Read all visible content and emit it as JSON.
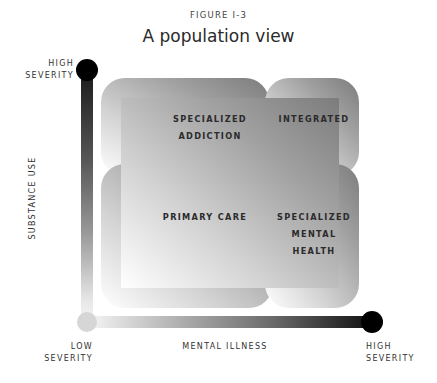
{
  "figure": {
    "label": "FIGURE I-3",
    "title": "A population view"
  },
  "axes": {
    "y": {
      "name": "SUBSTANCE USE",
      "high_label_line1": "HIGH",
      "high_label_line2": "SEVERITY"
    },
    "x": {
      "name": "MENTAL ILLNESS",
      "low_label_line1": "LOW",
      "low_label_line2": "SEVERITY",
      "high_label_line1": "HIGH",
      "high_label_line2": "SEVERITY"
    }
  },
  "regions": {
    "top_left": {
      "line1": "SPECIALIZED",
      "line2": "ADDICTION"
    },
    "top_right": {
      "line1": "INTEGRATED"
    },
    "bottom_left": {
      "line1": "PRIMARY CARE"
    },
    "bottom_right": {
      "line1": "SPECIALIZED",
      "line2": "MENTAL",
      "line3": "HEALTH"
    }
  },
  "colors": {
    "axis_high": "#000000",
    "axis_low": "#d6d6d6",
    "region_dark": "#7e7e7e",
    "region_light": "#ffffff"
  }
}
